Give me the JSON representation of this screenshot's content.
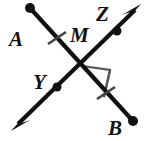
{
  "figure": {
    "background_color": "#ffffff",
    "stroke_color": "#111111",
    "tick_color": "#444444",
    "right_angle_color": "#555555",
    "labels": {
      "a": "A",
      "b": "B",
      "m": "M",
      "y": "Y",
      "z": "Z"
    },
    "label_positions": {
      "a": {
        "x": 9,
        "y": 46
      },
      "b": {
        "x": 108,
        "y": 135
      },
      "m": {
        "x": 70,
        "y": 42
      },
      "y": {
        "x": 33,
        "y": 89
      },
      "z": {
        "x": 96,
        "y": 21
      }
    },
    "segments": [
      {
        "name": "segment-AB",
        "from_label": "A",
        "to_label": "B",
        "x1": 30,
        "y1": 8,
        "x2": 133,
        "y2": 121,
        "endpoint_dots": [
          "A",
          "B"
        ],
        "tick_marks": 2
      },
      {
        "name": "line-YZ",
        "from_label": "Y",
        "to_label": "Z",
        "x1": 13,
        "y1": 129,
        "x2": 139,
        "y2": 6,
        "arrowheads": [
          "lower-left",
          "upper-right"
        ],
        "interior_dots": [
          "Y",
          "Z"
        ]
      }
    ],
    "dots": [
      {
        "name": "dot-A",
        "x": 30,
        "y": 8,
        "r": 5
      },
      {
        "name": "dot-B",
        "x": 133,
        "y": 121,
        "r": 5
      },
      {
        "name": "dot-Y",
        "x": 57,
        "y": 87,
        "r": 4.5
      },
      {
        "name": "dot-Z",
        "x": 117,
        "y": 31,
        "r": 4.5
      }
    ],
    "intersection": {
      "name": "point-M",
      "x": 82,
      "y": 66
    },
    "tick_marks": [
      {
        "name": "tick-MA",
        "cx": 57,
        "cy": 38
      },
      {
        "name": "tick-MB",
        "cx": 106,
        "cy": 93
      }
    ],
    "right_angle_marker": {
      "name": "right-angle-square",
      "points": "82,66 110,70 104,97"
    }
  }
}
